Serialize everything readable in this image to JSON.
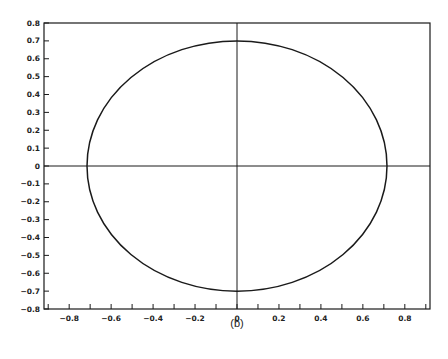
{
  "chart_data": {
    "type": "line",
    "title": "",
    "caption": "(b)",
    "xlabel": "",
    "ylabel": "",
    "xlim": [
      -0.92,
      0.92
    ],
    "ylim": [
      -0.8,
      0.8
    ],
    "grid": false,
    "legend": null,
    "x_ticks": [
      "-0.8",
      "-0.6",
      "-0.4",
      "-0.2",
      "0",
      "0.2",
      "0.4",
      "0.6",
      "0.8"
    ],
    "x_minor_ticks": [
      -0.9,
      -0.8,
      -0.7,
      -0.6,
      -0.5,
      -0.4,
      -0.3,
      -0.2,
      -0.1,
      0,
      0.1,
      0.2,
      0.3,
      0.4,
      0.5,
      0.6,
      0.7,
      0.8,
      0.9
    ],
    "y_ticks": [
      "0.8",
      "0.7",
      "0.6",
      "0.5",
      "0.4",
      "0.3",
      "0.2",
      "0.1",
      "0",
      "-0.1",
      "-0.2",
      "-0.3",
      "-0.4",
      "-0.5",
      "-0.6",
      "-0.7",
      "-0.8"
    ],
    "axes_lines": {
      "x": 0,
      "y": 0
    },
    "series": [
      {
        "name": "circle",
        "shape": "ellipse",
        "center": [
          0,
          0
        ],
        "x_radius": 0.715,
        "y_radius": 0.7,
        "color": "#1a1a1a"
      }
    ]
  }
}
